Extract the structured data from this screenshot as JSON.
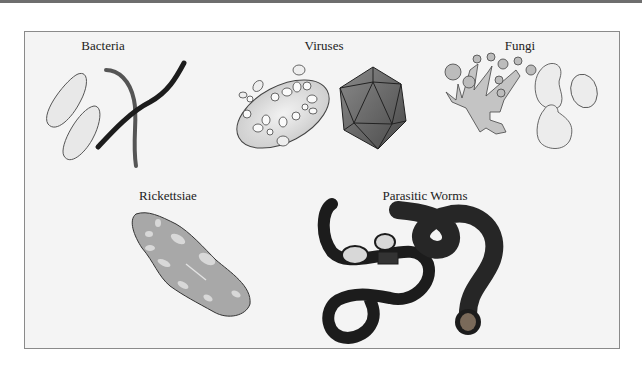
{
  "figure": {
    "categories": [
      {
        "id": "bacteria",
        "label": "Bacteria"
      },
      {
        "id": "viruses",
        "label": "Viruses"
      },
      {
        "id": "fungi",
        "label": "Fungi"
      },
      {
        "id": "rickettsiae",
        "label": "Rickettsiae"
      },
      {
        "id": "parasitic_worms",
        "label": "Parasitic Worms"
      }
    ]
  },
  "colors": {
    "frame_bg": "#f4f4f4",
    "frame_border": "#8a8a8a",
    "dark_fill": "#1c1c1c",
    "mid_gray": "#a8a8a8",
    "light_fill": "#e6e6e6"
  }
}
